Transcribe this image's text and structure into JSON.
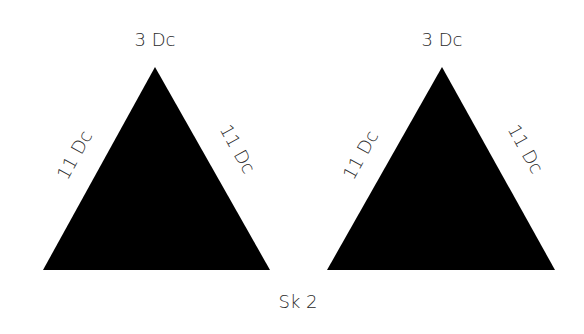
{
  "diagram": {
    "triangles": [
      {
        "id": "left",
        "top_label": "3 Dc",
        "left_side_label": "11 Dc",
        "right_side_label": "11 Dc",
        "fill": "#000000"
      },
      {
        "id": "right",
        "top_label": "3 Dc",
        "left_side_label": "11 Dc",
        "right_side_label": "11 Dc",
        "fill": "#000000"
      }
    ],
    "bottom_label": "Sk 2"
  }
}
